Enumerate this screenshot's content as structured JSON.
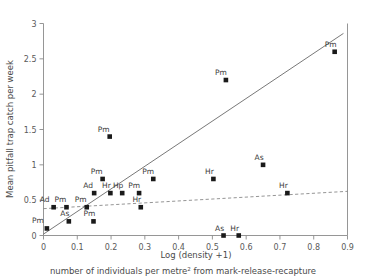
{
  "chart_data": {
    "type": "scatter",
    "title": "",
    "xlabel": "Log (density +1)",
    "ylabel": "Mean pitfall trap catch per week",
    "caption_prefix": "number of individuals per metre",
    "caption_superscript": "2",
    "caption_suffix": " from mark-release-recapture",
    "xlim": [
      0,
      0.9
    ],
    "ylim": [
      0,
      3
    ],
    "xticks": [
      "0",
      "0.1",
      "0.2",
      "0.3",
      "0.4",
      "0.5",
      "0.6",
      "0.7",
      "0.8",
      "0.9"
    ],
    "xtick_values": [
      0,
      0.1,
      0.2,
      0.3,
      0.4,
      0.5,
      0.6,
      0.7,
      0.8,
      0.9
    ],
    "yticks": [
      "0",
      "0.5",
      "1",
      "1.5",
      "2",
      "2.5",
      "3"
    ],
    "ytick_values": [
      0,
      0.5,
      1,
      1.5,
      2,
      2.5,
      3
    ],
    "grid": false,
    "legend": "none",
    "marker_shape": "square",
    "marker_color": "#1a1a1a",
    "points": [
      {
        "x": 0.01,
        "y": 0.1,
        "label": "Pm",
        "label_dx": -9,
        "label_dy": -5
      },
      {
        "x": 0.03,
        "y": 0.4,
        "label": "Ad",
        "label_dx": -9,
        "label_dy": -5
      },
      {
        "x": 0.068,
        "y": 0.4,
        "label": "Pm",
        "label_dx": -6,
        "label_dy": -5
      },
      {
        "x": 0.075,
        "y": 0.2,
        "label": "As",
        "label_dx": -4,
        "label_dy": -5
      },
      {
        "x": 0.128,
        "y": 0.4,
        "label": "Pm",
        "label_dx": -6,
        "label_dy": -5
      },
      {
        "x": 0.148,
        "y": 0.2,
        "label": "Pm",
        "label_dx": -4,
        "label_dy": -5
      },
      {
        "x": 0.15,
        "y": 0.6,
        "label": "Ad",
        "label_dx": -6,
        "label_dy": -5
      },
      {
        "x": 0.175,
        "y": 0.8,
        "label": "Pm",
        "label_dx": -6,
        "label_dy": -5
      },
      {
        "x": 0.196,
        "y": 1.4,
        "label": "Pm",
        "label_dx": -6,
        "label_dy": -5
      },
      {
        "x": 0.198,
        "y": 0.6,
        "label": "Hr",
        "label_dx": -4,
        "label_dy": -5
      },
      {
        "x": 0.233,
        "y": 0.6,
        "label": "Hp",
        "label_dx": -4,
        "label_dy": -5
      },
      {
        "x": 0.283,
        "y": 0.6,
        "label": "Pm",
        "label_dx": -5,
        "label_dy": -5
      },
      {
        "x": 0.288,
        "y": 0.4,
        "label": "Hr",
        "label_dx": -4,
        "label_dy": -5
      },
      {
        "x": 0.325,
        "y": 0.8,
        "label": "Pm",
        "label_dx": -5,
        "label_dy": -5
      },
      {
        "x": 0.503,
        "y": 0.8,
        "label": "Hr",
        "label_dx": -4,
        "label_dy": -5
      },
      {
        "x": 0.533,
        "y": 0.0,
        "label": "As",
        "label_dx": -4,
        "label_dy": -5
      },
      {
        "x": 0.54,
        "y": 2.2,
        "label": "Pm",
        "label_dx": -5,
        "label_dy": -5
      },
      {
        "x": 0.578,
        "y": 0.0,
        "label": "Hr",
        "label_dx": -4,
        "label_dy": -5
      },
      {
        "x": 0.65,
        "y": 1.0,
        "label": "As",
        "label_dx": -4,
        "label_dy": -5
      },
      {
        "x": 0.722,
        "y": 0.6,
        "label": "Hr",
        "label_dx": -4,
        "label_dy": -5
      },
      {
        "x": 0.862,
        "y": 2.6,
        "label": "Pm",
        "label_dx": -4,
        "label_dy": -5
      }
    ],
    "lines": [
      {
        "name": "solid-fit-line",
        "style": "solid",
        "x0": 0.0,
        "y0": 0.02,
        "x1": 0.888,
        "y1": 2.86
      },
      {
        "name": "dashed-fit-line",
        "style": "dashed",
        "x0": 0.0,
        "y0": 0.38,
        "x1": 0.9,
        "y1": 0.625
      }
    ]
  }
}
